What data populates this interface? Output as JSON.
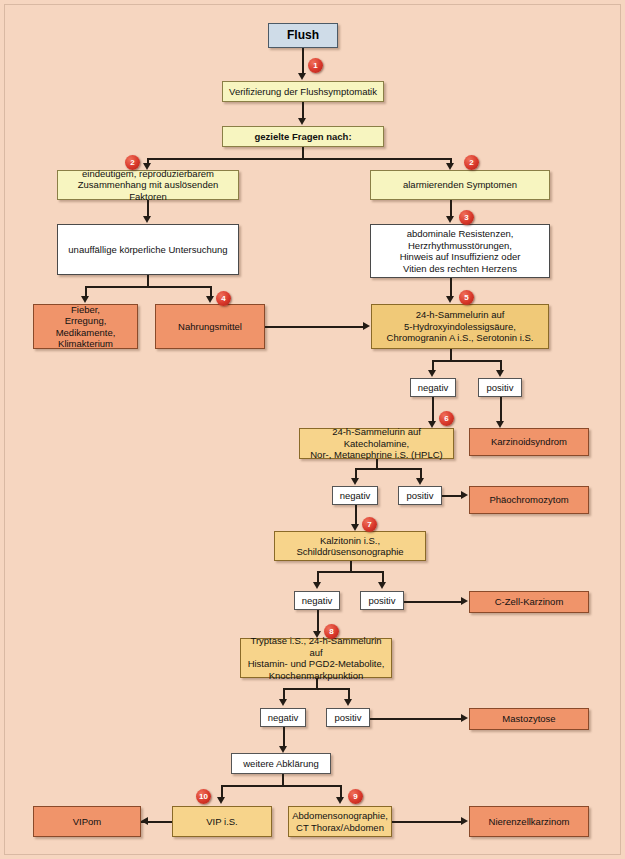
{
  "diagram": {
    "language": "de",
    "background_color": "#f6d6c0",
    "colors": {
      "start_box": "#cfdce8",
      "question_box": "#f7f5c0",
      "finding_box": "#ffffff",
      "test_box": "#f0c978",
      "diagnosis_box": "#f0946a",
      "badge": "#d8372a",
      "connector": "#231c15"
    },
    "nodes": {
      "start": "Flush",
      "verify": "Verifizierung der Flushsymptomatik",
      "questions": "gezielte Fragen nach:",
      "branch_left": "eindeutigem, reproduzierbarem\nZusammenhang mit auslösenden Faktoren",
      "branch_right": "alarmierenden Symptomen",
      "exam_left": "unauffällige körperliche Untersuchung",
      "findings_right": "abdominale Resistenzen,\nHerzrhythmusstörungen,\nHinweis auf Insuffizienz oder\nVitien des rechten Herzens",
      "causes_fever": "Fieber,\nErregung, Medikamente,\nKlimakterium",
      "causes_food": "Nahrungsmittel",
      "test_5hiaa": "24-h-Sammelurin auf\n5-Hydroxyindolessigsäure,\nChromogranin A i.S., Serotonin i.S.",
      "test_catecholamines": "24-h-Sammelurin auf Katecholamine,\nNor-, Metanephrine i.S. (HPLC)",
      "test_calcitonin": "Kalzitonin i.S.,\nSchilddrüsensonographie",
      "test_tryptase": "Tryptase i.S., 24-h-Sammelurin auf\nHistamin- und PGD2-Metabolite,\nKnochenmarkpunktion",
      "further_workup": "weitere Abklärung",
      "test_vip": "VIP i.S.",
      "test_imaging": "Abdomensonographie,\nCT Thorax/Abdomen",
      "dx_carcinoid": "Karzinoidsyndrom",
      "dx_pheo": "Phäochromozytom",
      "dx_czell": "C-Zell-Karzinom",
      "dx_masto": "Mastozytose",
      "dx_vipom": "VIPom",
      "dx_renal": "Nierenzellkarzinom"
    },
    "result_labels": {
      "negative": "negativ",
      "positive": "positiv"
    },
    "chips": [
      {
        "id": "c1n",
        "label": "negativ"
      },
      {
        "id": "c1p",
        "label": "positiv"
      },
      {
        "id": "c2n",
        "label": "negativ"
      },
      {
        "id": "c2p",
        "label": "positiv"
      },
      {
        "id": "c3n",
        "label": "negativ"
      },
      {
        "id": "c3p",
        "label": "positiv"
      },
      {
        "id": "c4n",
        "label": "negativ"
      },
      {
        "id": "c4p",
        "label": "positiv"
      }
    ],
    "badges": [
      {
        "id": "b1",
        "number": "1"
      },
      {
        "id": "b2a",
        "number": "2"
      },
      {
        "id": "b2b",
        "number": "2"
      },
      {
        "id": "b3",
        "number": "3"
      },
      {
        "id": "b4",
        "number": "4"
      },
      {
        "id": "b5",
        "number": "5"
      },
      {
        "id": "b6",
        "number": "6"
      },
      {
        "id": "b7",
        "number": "7"
      },
      {
        "id": "b8",
        "number": "8"
      },
      {
        "id": "b9",
        "number": "9"
      },
      {
        "id": "b10",
        "number": "10"
      }
    ]
  }
}
